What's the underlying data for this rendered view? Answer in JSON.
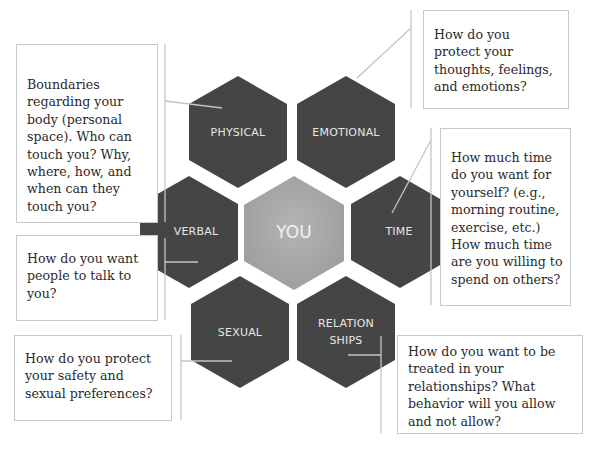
{
  "diagram": {
    "center": {
      "label": "YOU",
      "color": "#a9a9a9"
    },
    "hex_color": "#454545",
    "line_color": "#c4c4c4",
    "hexagons": [
      {
        "id": "physical",
        "label": "PHYSICAL",
        "cx": 238,
        "cy": 132
      },
      {
        "id": "emotional",
        "label": "EMOTIONAL",
        "cx": 346,
        "cy": 132
      },
      {
        "id": "verbal",
        "label": "VERBAL",
        "cx": 189,
        "cy": 232
      },
      {
        "id": "time",
        "label": "TIME",
        "cx": 400,
        "cy": 232
      },
      {
        "id": "sexual",
        "label": "SEXUAL",
        "cx": 240,
        "cy": 332
      },
      {
        "id": "relationships",
        "label_line1": "RELATION",
        "label_line2": "SHIPS",
        "cx": 346,
        "cy": 332
      }
    ],
    "callouts": {
      "physical": "Boundaries regarding your body (personal space). Who can touch you? Why, where, how, and when can they touch you?",
      "emotional": "How do you protect your thoughts, feelings, and emotions?",
      "time": "How much time do you want for yourself? (e.g., morning routine, exercise, etc.) How much time are you willing to spend on others?",
      "verbal": "How do you want people to talk to you?",
      "sexual": "How do you protect your safety and sexual preferences?",
      "relationships": "How do you want to be treated in your relationships? What behavior will you allow and not allow?"
    }
  }
}
